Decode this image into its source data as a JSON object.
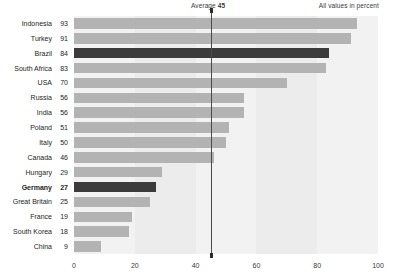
{
  "annotations": {
    "average_label": "Average",
    "average_value": "45",
    "unit_note": "All values in percent"
  },
  "chart_data": {
    "type": "bar",
    "orientation": "horizontal",
    "title": "",
    "subtitle": "",
    "xlabel": "",
    "ylabel": "",
    "xlim": [
      0,
      100
    ],
    "ylim": null,
    "grid": false,
    "legend_position": "none",
    "categories": [
      "Indonesia",
      "Turkey",
      "Brazil",
      "South Africa",
      "USA",
      "Russia",
      "India",
      "Poland",
      "Italy",
      "Canada",
      "Hungary",
      "Germany",
      "Great Britain",
      "France",
      "South Korea",
      "China"
    ],
    "values": [
      93,
      91,
      84,
      83,
      70,
      56,
      56,
      51,
      50,
      46,
      29,
      27,
      25,
      19,
      18,
      9
    ],
    "highlighted": [
      "Brazil",
      "Germany"
    ],
    "bold_labels": [
      "Germany"
    ],
    "xticks": [
      0,
      20,
      40,
      60,
      80,
      100
    ],
    "xtick_labels": [
      "0",
      "20",
      "40",
      "60",
      "80",
      "100"
    ],
    "annotations": [
      {
        "name": "average",
        "label": "Average",
        "value": 45
      }
    ],
    "colors": {
      "bar": "#b3b3b3",
      "bar_highlight": "#3b3b3b",
      "plot_background": "#f2f2f2",
      "band_background": "#ececec",
      "average_line": "#4b4b4b",
      "text": "#231f20",
      "page_background": "#ffffff"
    }
  }
}
